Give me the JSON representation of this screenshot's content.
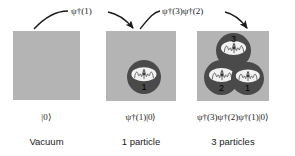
{
  "figure": {
    "panels": [
      {
        "id": "vacuum",
        "state_label": "|0⟩",
        "caption": "Vacuum",
        "particle_count": 0,
        "box_color": "#b4b4b4",
        "particles": []
      },
      {
        "id": "one_particle",
        "state_label": "ψ†(1)|0⟩",
        "caption": "1 particle",
        "particle_count": 1,
        "box_color": "#b4b4b4",
        "particles": [
          {
            "number": "1",
            "color": "#4a4a4a",
            "core_color": "#f2f2f2"
          }
        ]
      },
      {
        "id": "three_particles",
        "state_label": "ψ†(3)ψ†(2)ψ†(1)|0⟩",
        "caption": "3 particles",
        "particle_count": 3,
        "box_color": "#b4b4b4",
        "particles": [
          {
            "number": "3",
            "color": "#4a4a4a",
            "core_color": "#f2f2f2"
          },
          {
            "number": "2",
            "color": "#4a4a4a",
            "core_color": "#f2f2f2"
          },
          {
            "number": "1",
            "color": "#4a4a4a",
            "core_color": "#f2f2f2"
          }
        ]
      }
    ],
    "arrows": [
      {
        "id": "arrow_1",
        "label": "ψ†(1)",
        "from": "vacuum",
        "to": "one_particle"
      },
      {
        "id": "arrow_2",
        "label": "ψ†(3)ψ†(2)",
        "from": "one_particle",
        "to": "three_particles"
      }
    ],
    "colors": {
      "background": "#ffffff",
      "panel": "#b4b4b4",
      "particle": "#4a4a4a",
      "particle_core": "#f2f2f2",
      "ink": "#1a1a1a"
    }
  }
}
